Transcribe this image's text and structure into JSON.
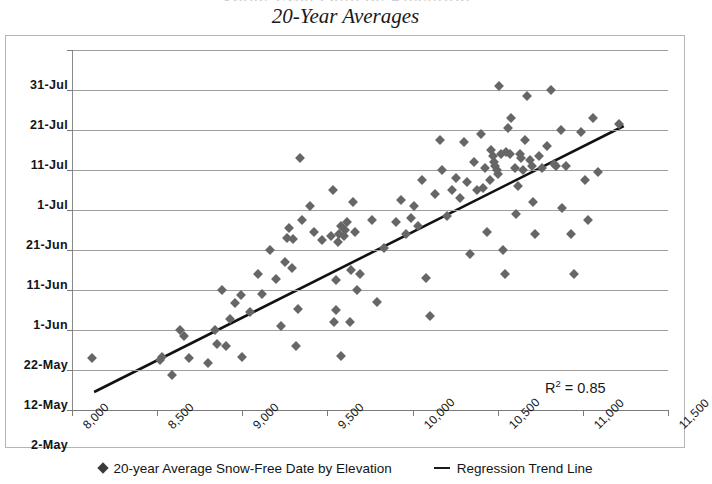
{
  "title": {
    "main": "20-Year Averages",
    "clipped_above": "Snow-Free Date by Elevation"
  },
  "annotation": {
    "r_squared_prefix": "R",
    "r_squared_exponent": "2",
    "r_squared_value": " = 0.85"
  },
  "legend": {
    "items": [
      {
        "label": "20-year Average Snow-Free Date by Elevation",
        "marker": "diamond-marker"
      },
      {
        "label": "Regression Trend Line",
        "marker": "line-marker"
      }
    ]
  },
  "colors": {
    "marker": "#666666",
    "trendline": "#111111",
    "gridline": "#9e9e9e",
    "axis": "#8a8a8a",
    "text": "#141414"
  },
  "chart_data": {
    "type": "scatter",
    "title": "20-Year Averages",
    "xlabel": "",
    "ylabel": "",
    "xlim": [
      8000,
      11500
    ],
    "ylim": [
      0,
      90
    ],
    "grid": true,
    "legend_position": "bottom",
    "x_ticks": [
      8000,
      8500,
      9000,
      9500,
      10000,
      10500,
      11000,
      11500
    ],
    "x_tick_labels": [
      "8,000",
      "8,500",
      "9,000",
      "9,500",
      "10,000",
      "10,500",
      "11,000",
      "11,500"
    ],
    "y_ticks": [
      0,
      10,
      20,
      30,
      40,
      50,
      60,
      70,
      80,
      90
    ],
    "y_tick_labels": [
      "2-May",
      "12-May",
      "22-May",
      "1-Jun",
      "11-Jun",
      "21-Jun",
      "1-Jul",
      "11-Jul",
      "21-Jul",
      "31-Jul"
    ],
    "y_axis_note": "Day-of-year offset in days from 2-May (0 = 2-May, 90 = 31-Jul)",
    "annotations": [
      {
        "text": "R² = 0.85",
        "x": 11150,
        "y": 5
      }
    ],
    "series": [
      {
        "name": "20-year Average Snow-Free Date by Elevation",
        "type": "scatter",
        "marker": "diamond",
        "color": "#666666",
        "points": [
          [
            8118,
            13.0
          ],
          [
            8515,
            12.5
          ],
          [
            8531,
            13.2
          ],
          [
            8585,
            8.8
          ],
          [
            8637,
            20.0
          ],
          [
            8660,
            18.5
          ],
          [
            8690,
            13.0
          ],
          [
            8800,
            11.8
          ],
          [
            8838,
            20.0
          ],
          [
            8852,
            16.5
          ],
          [
            8880,
            30.0
          ],
          [
            8907,
            16.0
          ],
          [
            8925,
            22.7
          ],
          [
            8960,
            26.8
          ],
          [
            8990,
            28.8
          ],
          [
            9000,
            13.2
          ],
          [
            9048,
            24.5
          ],
          [
            9095,
            34.0
          ],
          [
            9118,
            29.0
          ],
          [
            9160,
            40.0
          ],
          [
            9200,
            32.8
          ],
          [
            9230,
            21.0
          ],
          [
            9252,
            37.0
          ],
          [
            9260,
            43.0
          ],
          [
            9275,
            45.5
          ],
          [
            9290,
            35.5
          ],
          [
            9300,
            42.8
          ],
          [
            9318,
            16.0
          ],
          [
            9330,
            25.3
          ],
          [
            9338,
            63.0
          ],
          [
            9350,
            47.5
          ],
          [
            9395,
            51.0
          ],
          [
            9420,
            44.5
          ],
          [
            9470,
            42.5
          ],
          [
            9520,
            43.5
          ],
          [
            9532,
            55.0
          ],
          [
            9540,
            22.0
          ],
          [
            9548,
            25.0
          ],
          [
            9552,
            32.5
          ],
          [
            9560,
            42.0
          ],
          [
            9570,
            44.0
          ],
          [
            9578,
            46.0
          ],
          [
            9582,
            13.5
          ],
          [
            9600,
            43.5
          ],
          [
            9605,
            45.0
          ],
          [
            9612,
            47.0
          ],
          [
            9630,
            22.0
          ],
          [
            9640,
            35.0
          ],
          [
            9650,
            52.0
          ],
          [
            9660,
            44.5
          ],
          [
            9672,
            30.0
          ],
          [
            9690,
            34.0
          ],
          [
            9760,
            47.5
          ],
          [
            9790,
            27.0
          ],
          [
            9830,
            40.5
          ],
          [
            9900,
            47.0
          ],
          [
            9930,
            52.5
          ],
          [
            9960,
            44.0
          ],
          [
            9990,
            48.0
          ],
          [
            10010,
            51.0
          ],
          [
            10030,
            46.0
          ],
          [
            10055,
            57.5
          ],
          [
            10080,
            33.0
          ],
          [
            10100,
            23.5
          ],
          [
            10130,
            54.0
          ],
          [
            10160,
            67.5
          ],
          [
            10175,
            60.0
          ],
          [
            10200,
            48.5
          ],
          [
            10230,
            55.0
          ],
          [
            10255,
            58.0
          ],
          [
            10280,
            53.0
          ],
          [
            10300,
            67.0
          ],
          [
            10320,
            57.0
          ],
          [
            10340,
            39.0
          ],
          [
            10360,
            62.0
          ],
          [
            10380,
            55.0
          ],
          [
            10400,
            69.0
          ],
          [
            10415,
            55.5
          ],
          [
            10425,
            60.5
          ],
          [
            10440,
            44.5
          ],
          [
            10455,
            57.5
          ],
          [
            10460,
            65.0
          ],
          [
            10470,
            63.5
          ],
          [
            10478,
            62.0
          ],
          [
            10485,
            61.0
          ],
          [
            10495,
            60.0
          ],
          [
            10500,
            59.0
          ],
          [
            10510,
            81.0
          ],
          [
            10520,
            64.0
          ],
          [
            10530,
            40.0
          ],
          [
            10540,
            34.0
          ],
          [
            10550,
            64.5
          ],
          [
            10560,
            70.5
          ],
          [
            10570,
            64.0
          ],
          [
            10580,
            73.0
          ],
          [
            10600,
            60.5
          ],
          [
            10610,
            49.0
          ],
          [
            10620,
            56.0
          ],
          [
            10630,
            64.0
          ],
          [
            10635,
            63.0
          ],
          [
            10650,
            60.0
          ],
          [
            10660,
            67.5
          ],
          [
            10670,
            78.5
          ],
          [
            10690,
            62.5
          ],
          [
            10700,
            61.0
          ],
          [
            10710,
            52.0
          ],
          [
            10720,
            44.0
          ],
          [
            10740,
            63.5
          ],
          [
            10760,
            60.5
          ],
          [
            10790,
            66.0
          ],
          [
            10810,
            80.0
          ],
          [
            10830,
            61.5
          ],
          [
            10840,
            61.0
          ],
          [
            10870,
            70.0
          ],
          [
            10880,
            50.5
          ],
          [
            10900,
            61.0
          ],
          [
            10930,
            44.0
          ],
          [
            10950,
            34.0
          ],
          [
            10990,
            69.5
          ],
          [
            11010,
            57.5
          ],
          [
            11030,
            47.5
          ],
          [
            11060,
            73.0
          ],
          [
            11090,
            59.5
          ],
          [
            11210,
            71.5
          ]
        ]
      },
      {
        "name": "Regression Trend Line",
        "type": "line",
        "color": "#111111",
        "endpoints": [
          [
            8130,
            4.5
          ],
          [
            11240,
            71.0
          ]
        ],
        "r_squared": 0.85
      }
    ]
  }
}
